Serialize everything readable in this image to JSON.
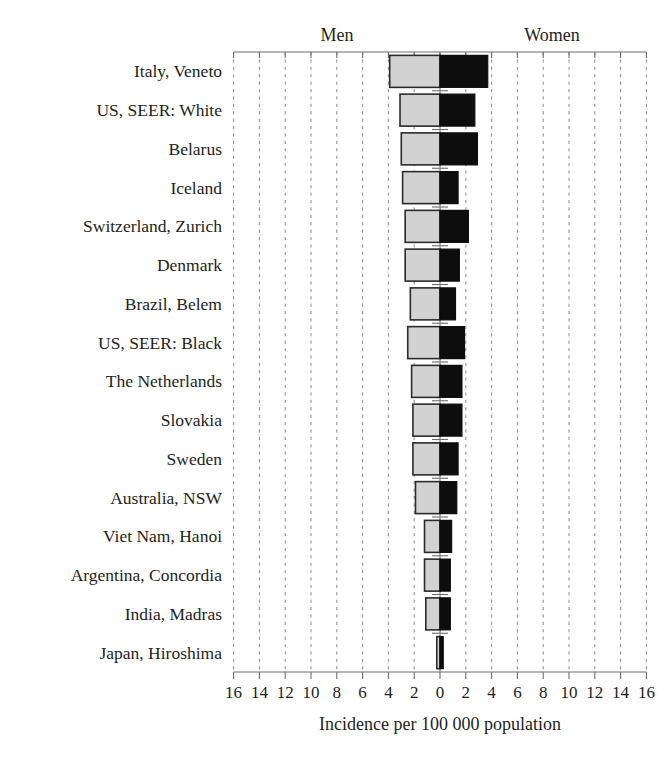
{
  "chart_data": {
    "type": "bar",
    "orientation": "horizontal",
    "layout": "diverging-back-to-back",
    "title": "",
    "subtitle": "",
    "xlabel": "Incidence per 100 000 population",
    "ylabel": "",
    "xlim": [
      -16,
      16
    ],
    "grid": true,
    "legend_position": "top",
    "group_labels": {
      "left": "Men",
      "right": "Women"
    },
    "axis_ticks": {
      "left_values": [
        16,
        14,
        12,
        10,
        8,
        6,
        4,
        2
      ],
      "zero": 0,
      "right_values": [
        2,
        4,
        6,
        8,
        10,
        12,
        14,
        16
      ],
      "all_labels": [
        "16",
        "14",
        "12",
        "10",
        "8",
        "6",
        "4",
        "2",
        "0",
        "2",
        "4",
        "6",
        "8",
        "10",
        "12",
        "14",
        "16"
      ]
    },
    "categories": [
      "Italy, Veneto",
      "US, SEER:  White",
      "Belarus",
      "Iceland",
      "Switzerland, Zurich",
      "Denmark",
      "Brazil, Belem",
      "US, SEER: Black",
      "The Netherlands",
      "Slovakia",
      "Sweden",
      "Australia, NSW",
      "Viet Nam, Hanoi",
      "Argentina, Concordia",
      "India, Madras",
      "Japan, Hiroshima"
    ],
    "series": [
      {
        "name": "Men",
        "side": "left",
        "color": "#d2d2d2",
        "values": [
          3.9,
          3.1,
          3.0,
          2.9,
          2.7,
          2.7,
          2.3,
          2.5,
          2.2,
          2.1,
          2.1,
          1.9,
          1.2,
          1.2,
          1.1,
          0.25
        ]
      },
      {
        "name": "Women",
        "side": "right",
        "color": "#0d0d0d",
        "values": [
          3.7,
          2.7,
          2.9,
          1.4,
          2.2,
          1.5,
          1.2,
          1.9,
          1.7,
          1.7,
          1.4,
          1.3,
          0.9,
          0.8,
          0.8,
          0.25
        ]
      }
    ]
  },
  "chart": {
    "men_label": "Men",
    "women_label": "Women",
    "axis_title": "Incidence per 100 000 population"
  }
}
